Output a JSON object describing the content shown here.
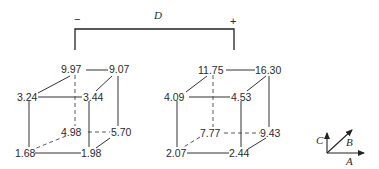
{
  "factor_bracket": {
    "label": "D",
    "low_sign": "−",
    "high_sign": "+"
  },
  "cubes": [
    {
      "level": "−",
      "back_top_left": "9.97",
      "back_top_right": "9.07",
      "front_top_left": "3.24",
      "front_top_right": "3.44",
      "back_bottom_left": "4.98",
      "back_bottom_right": "5.70",
      "front_bottom_left": "1.68",
      "front_bottom_right": "1.98"
    },
    {
      "level": "+",
      "back_top_left": "11.75",
      "back_top_right": "16.30",
      "front_top_left": "4.09",
      "front_top_right": "4.53",
      "back_bottom_left": "7.77",
      "back_bottom_right": "9.43",
      "front_bottom_left": "2.07",
      "front_bottom_right": "2.44"
    }
  ],
  "axes": {
    "a_label": "A",
    "b_label": "B",
    "c_label": "C"
  }
}
